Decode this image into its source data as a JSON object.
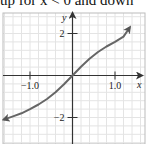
{
  "caption": "up for x < 0 and down",
  "chart_data": {
    "type": "line",
    "title": "",
    "xlabel": "x",
    "ylabel": "y",
    "xlim": [
      -1.65,
      1.65
    ],
    "ylim": [
      -2.6,
      3.0
    ],
    "x_ticks": [
      {
        "value": -1.0,
        "label": "−1.0"
      },
      {
        "value": 1.0,
        "label": "1.0"
      }
    ],
    "y_ticks": [
      {
        "value": 2,
        "label": "2"
      },
      {
        "value": -2,
        "label": "−2"
      }
    ],
    "grid": true,
    "series": [
      {
        "name": "curve",
        "x": [
          -1.62,
          -1.4,
          -1.2,
          -1.0,
          -0.8,
          -0.6,
          -0.4,
          -0.2,
          0.0,
          0.2,
          0.4,
          0.6,
          0.8,
          1.0,
          1.2,
          1.35
        ],
        "y": [
          -2.1,
          -1.95,
          -1.8,
          -1.6,
          -1.38,
          -1.12,
          -0.8,
          -0.42,
          0.0,
          0.42,
          0.8,
          1.12,
          1.38,
          1.6,
          1.85,
          2.3
        ],
        "arrows": "both"
      }
    ]
  }
}
